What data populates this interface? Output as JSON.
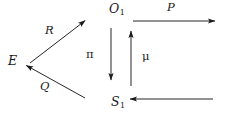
{
  "diagram": {
    "type": "commutative-diagram",
    "background_color": "#ffffff",
    "stroke_color": "#1a1a1a",
    "nodes": [
      {
        "id": "E",
        "label": "E",
        "subscript": "",
        "x": 13,
        "y": 62
      },
      {
        "id": "O1",
        "label": "O",
        "subscript": "1",
        "x": 117,
        "y": 11
      },
      {
        "id": "S1",
        "label": "S",
        "subscript": "1",
        "x": 118,
        "y": 104
      }
    ],
    "edges": [
      {
        "id": "R",
        "label": "R",
        "from": "E",
        "to": "upper-right",
        "direction": "up-right",
        "style": "solid",
        "arrowhead": "to",
        "x1": 30,
        "y1": 63,
        "x2": 86,
        "y2": 20
      },
      {
        "id": "Q",
        "label": "Q",
        "from": "lower-right",
        "to": "E",
        "direction": "up-left",
        "style": "solid",
        "arrowhead": "to",
        "x1": 85,
        "y1": 98,
        "x2": 25,
        "y2": 65
      },
      {
        "id": "P",
        "label": "P",
        "from": "O1",
        "to": "right",
        "direction": "right",
        "style": "solid",
        "arrowhead": "to",
        "x1": 133,
        "y1": 21,
        "x2": 216,
        "y2": 21
      },
      {
        "id": "pi",
        "label": "π",
        "from": "O1",
        "to": "S1",
        "direction": "down",
        "style": "solid",
        "arrowhead": "to",
        "x1": 111,
        "y1": 28,
        "x2": 111,
        "y2": 81
      },
      {
        "id": "mu",
        "label": "μ",
        "from": "S1",
        "to": "O1",
        "direction": "up",
        "style": "solid",
        "arrowhead": "to",
        "x1": 131,
        "y1": 86,
        "x2": 131,
        "y2": 30
      },
      {
        "id": "bottom",
        "label": "",
        "from": "right",
        "to": "S1",
        "direction": "left",
        "style": "solid",
        "arrowhead": "to",
        "x1": 213,
        "y1": 99,
        "x2": 129,
        "y2": 99
      }
    ]
  }
}
